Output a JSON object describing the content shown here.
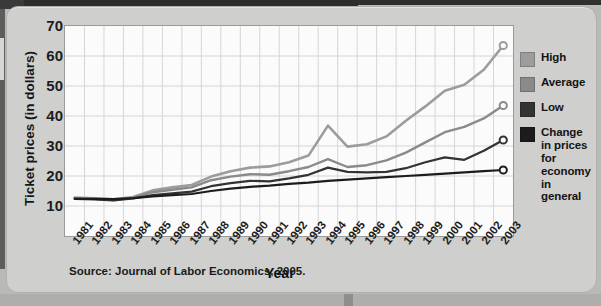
{
  "chart_data": {
    "type": "line",
    "title": "",
    "xlabel": "Year",
    "ylabel": "Ticket prices (in dollars)",
    "ylim": [
      0,
      70
    ],
    "yticks": [
      70,
      60,
      50,
      40,
      30,
      20,
      10
    ],
    "grid": true,
    "legend_position": "right",
    "x": [
      1981,
      1982,
      1983,
      1984,
      1985,
      1986,
      1987,
      1988,
      1989,
      1990,
      1991,
      1992,
      1993,
      1994,
      1995,
      1996,
      1997,
      1998,
      1999,
      2000,
      2001,
      2002,
      2003
    ],
    "categories": [
      "1981",
      "1982",
      "1983",
      "1984",
      "1985",
      "1986",
      "1987",
      "1988",
      "1989",
      "1990",
      "1991",
      "1992",
      "1993",
      "1994",
      "1995",
      "1996",
      "1997",
      "1998",
      "1999",
      "2000",
      "2001",
      "2002",
      "2003"
    ],
    "series": [
      {
        "name": "High",
        "color": "#9c9c9c",
        "values": [
          12.8,
          12.6,
          12.2,
          13.0,
          15.2,
          16.2,
          17.0,
          19.8,
          21.6,
          22.8,
          23.2,
          24.6,
          26.8,
          36.8,
          29.8,
          30.6,
          33.2,
          38.4,
          43.2,
          48.4,
          50.4,
          55.4,
          63.5
        ]
      },
      {
        "name": "Average",
        "color": "#8a8a8a",
        "values": [
          12.6,
          12.4,
          12.0,
          12.8,
          14.6,
          15.4,
          16.2,
          18.6,
          19.8,
          20.6,
          20.4,
          21.6,
          23.0,
          25.6,
          23.0,
          23.6,
          25.2,
          27.8,
          31.2,
          34.6,
          36.4,
          39.2,
          43.5
        ]
      },
      {
        "name": "Low",
        "color": "#333333",
        "values": [
          12.4,
          12.2,
          11.9,
          12.5,
          13.6,
          14.2,
          14.8,
          16.6,
          17.6,
          18.4,
          18.2,
          19.2,
          20.4,
          22.8,
          21.4,
          21.2,
          21.4,
          22.6,
          24.6,
          26.2,
          25.4,
          28.4,
          32.0
        ]
      },
      {
        "name": "Change in prices for economy in general",
        "color": "#1c1c1c",
        "values": [
          12.4,
          12.4,
          12.3,
          12.6,
          13.2,
          13.6,
          14.0,
          15.0,
          15.8,
          16.4,
          16.8,
          17.4,
          17.8,
          18.4,
          18.8,
          19.2,
          19.6,
          20.0,
          20.4,
          20.8,
          21.2,
          21.6,
          22.0
        ]
      }
    ],
    "endpoint_markers": [
      {
        "series": "High",
        "x": 2003,
        "y": 63.5
      },
      {
        "series": "Average",
        "x": 2003,
        "y": 43.5
      },
      {
        "series": "Low",
        "x": 2003,
        "y": 32.0
      },
      {
        "series": "Change in prices for economy in general",
        "x": 2003,
        "y": 22.0
      }
    ]
  },
  "legend": {
    "items": [
      {
        "label": "High",
        "color": "#9c9c9c"
      },
      {
        "label": "Average",
        "color": "#8a8a8a"
      },
      {
        "label": "Low",
        "color": "#333333"
      },
      {
        "label": "Change in prices for economy in general",
        "color": "#1c1c1c"
      }
    ]
  },
  "axes": {
    "y_title": "Ticket prices (in dollars)",
    "x_title": "Year"
  },
  "footer": {
    "source": "Source: Journal of Labor Economics, 2005."
  },
  "colors": {
    "panel_background": "#cfcfcd",
    "plot_background": "#fbfbfb",
    "gridline": "#d6d6d6",
    "axis_line": "#9a9a98",
    "text": "#1d1d1d"
  }
}
